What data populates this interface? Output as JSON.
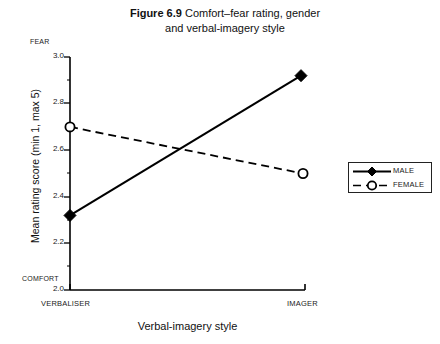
{
  "figure": {
    "number_label": "Figure 6.9",
    "title_line1": "Comfort–fear rating, gender",
    "title_line2": "and verbal-imagery style"
  },
  "axes": {
    "y_axis_label": "Mean rating score (min 1, max 5)",
    "y_top_cap": "FEAR",
    "y_bottom_cap": "COMFORT",
    "y_ticks": [
      "3.0",
      "2.8",
      "2.6",
      "2.4",
      "2.2",
      "2.0"
    ],
    "x_axis_label": "Verbal-imagery style",
    "x_ticks": [
      "VERBALISER",
      "IMAGER"
    ]
  },
  "legend": {
    "position": "right",
    "entries": [
      {
        "label": "MALE",
        "marker": "filled-diamond",
        "line": "solid"
      },
      {
        "label": "FEMALE",
        "marker": "open-circle",
        "line": "dashed"
      }
    ]
  },
  "colors": {
    "line": "#000000",
    "text": "#1a1a1a",
    "background": "#ffffff"
  },
  "chart_data": {
    "type": "line",
    "title": "Figure 6.9 Comfort–fear rating, gender and verbal-imagery style",
    "xlabel": "Verbal-imagery style",
    "ylabel": "Mean rating score (min 1, max 5)",
    "categories": [
      "VERBALISER",
      "IMAGER"
    ],
    "ylim": [
      2.0,
      3.0
    ],
    "yticks": [
      2.0,
      2.2,
      2.4,
      2.6,
      2.8,
      3.0
    ],
    "grid": false,
    "legend_position": "right",
    "series": [
      {
        "name": "MALE",
        "values": [
          2.32,
          2.92
        ],
        "marker": "filled-diamond",
        "linestyle": "solid"
      },
      {
        "name": "FEMALE",
        "values": [
          2.7,
          2.5
        ],
        "marker": "open-circle",
        "linestyle": "dashed"
      }
    ],
    "annotations": [
      {
        "text": "FEAR",
        "at": "y-axis-top"
      },
      {
        "text": "COMFORT",
        "at": "y-axis-bottom"
      }
    ]
  }
}
